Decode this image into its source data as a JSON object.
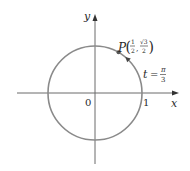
{
  "diagram": {
    "type": "unit-circle",
    "colors": {
      "circle": "#8a8a8a",
      "axes": "#6a6a6a",
      "text": "#2a2a2a",
      "point": "#555555"
    },
    "axes": {
      "x_label": "x",
      "y_label": "y"
    },
    "ticks": {
      "origin_label": "0",
      "one_label": "1"
    },
    "circle": {
      "radius": 1,
      "center": [
        0,
        0
      ]
    },
    "point": {
      "name": "P",
      "x_num": "1",
      "x_den": "2",
      "y_num": "√3",
      "y_den": "2",
      "x_value": 0.5,
      "y_value": 0.866,
      "angle_rad": 1.0472
    },
    "angle_label": {
      "variable": "t",
      "equals": "=",
      "num": "π",
      "den": "3"
    }
  }
}
